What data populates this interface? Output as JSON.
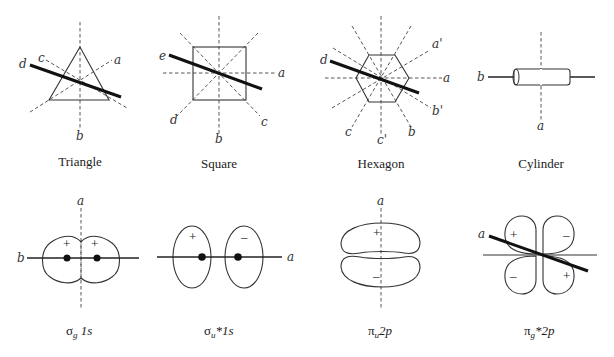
{
  "figure": {
    "top_row": [
      {
        "id": "triangle",
        "caption": "Triangle",
        "axis_labels": {
          "a": "a",
          "b": "b",
          "c": "c",
          "d": "d"
        }
      },
      {
        "id": "square",
        "caption": "Square",
        "axis_labels": {
          "a": "a",
          "b": "b",
          "c": "c",
          "d": "d",
          "e": "e"
        }
      },
      {
        "id": "hexagon",
        "caption": "Hexagon",
        "axis_labels": {
          "a": "a",
          "a_prime": "a'",
          "b": "b",
          "b_prime": "b'",
          "c": "c",
          "c_prime": "c'",
          "d": "d"
        }
      },
      {
        "id": "cylinder",
        "caption": "Cylinder",
        "axis_labels": {
          "a": "a",
          "b": "b"
        }
      }
    ],
    "bottom_row": [
      {
        "id": "sigma_g_1s",
        "caption_main": "σ",
        "caption_sub": "g",
        "caption_rest": " 1s",
        "axis_labels": {
          "a": "a",
          "b": "b"
        },
        "signs": [
          "+",
          "+"
        ]
      },
      {
        "id": "sigma_u_star_1s",
        "caption_main": "σ",
        "caption_sub": "u",
        "caption_rest": "*1s",
        "axis_labels": {
          "a": "a"
        },
        "signs": [
          "+",
          "–"
        ]
      },
      {
        "id": "pi_u_2p",
        "caption_main": "π",
        "caption_sub": "u",
        "caption_rest": "2p",
        "axis_labels": {
          "a": "a"
        },
        "signs": [
          "+",
          "–"
        ]
      },
      {
        "id": "pi_g_star_2p",
        "caption_main": "π",
        "caption_sub": "g",
        "caption_rest": "*2p",
        "axis_labels": {
          "a": "a"
        },
        "signs": [
          "+",
          "–",
          "–",
          "+"
        ]
      }
    ]
  }
}
